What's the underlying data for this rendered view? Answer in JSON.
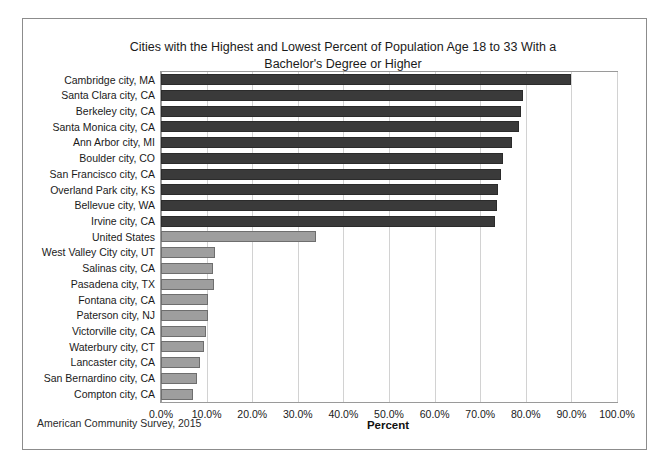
{
  "chart_data": {
    "type": "bar",
    "orientation": "horizontal",
    "title": "Cities with the Highest and Lowest Percent of Population Age 18 to 33 With a Bachelor's Degree or Higher",
    "title_line1": "Cities with the Highest and Lowest Percent of Population Age 18 to 33 With a",
    "title_line2": "Bachelor's Degree or Higher",
    "xlabel": "Percent",
    "ylabel": "",
    "source_note": "American Community Survey, 2015",
    "xlim": [
      0,
      100
    ],
    "xticks": [
      "0.0%",
      "10.0%",
      "20.0%",
      "30.0%",
      "40.0%",
      "50.0%",
      "60.0%",
      "70.0%",
      "80.0%",
      "90.0%",
      "100.0%"
    ],
    "xtick_values": [
      0,
      10,
      20,
      30,
      40,
      50,
      60,
      70,
      80,
      90,
      100
    ],
    "grid": "vertical",
    "legend": "none",
    "colors": {
      "high_bar": "#3a3a3a",
      "low_bar": "#9e9e9e",
      "us_bar": "#9e9e9e",
      "gridline": "#d2d2d2",
      "frame": "#8c8c8c"
    },
    "categories": [
      "Cambridge city, MA",
      "Santa Clara city, CA",
      "Berkeley city, CA",
      "Santa Monica city, CA",
      "Ann Arbor city, MI",
      "Boulder city, CO",
      "San Francisco city, CA",
      "Overland Park city, KS",
      "Bellevue city, WA",
      "Irvine city, CA",
      "United States",
      "West Valley City city, UT",
      "Salinas city, CA",
      "Pasadena city, TX",
      "Fontana city, CA",
      "Paterson city, NJ",
      "Victorville city, CA",
      "Waterbury city, CT",
      "Lancaster city, CA",
      "San Bernardino city, CA",
      "Compton city, CA"
    ],
    "values": [
      90.0,
      79.4,
      78.9,
      78.6,
      77.0,
      75.0,
      74.6,
      73.9,
      73.6,
      73.2,
      34.0,
      11.9,
      11.5,
      11.6,
      10.4,
      10.2,
      9.9,
      9.5,
      8.6,
      8.0,
      7.0
    ],
    "series_kind": [
      "high",
      "high",
      "high",
      "high",
      "high",
      "high",
      "high",
      "high",
      "high",
      "high",
      "reference",
      "low",
      "low",
      "low",
      "low",
      "low",
      "low",
      "low",
      "low",
      "low",
      "low"
    ]
  }
}
